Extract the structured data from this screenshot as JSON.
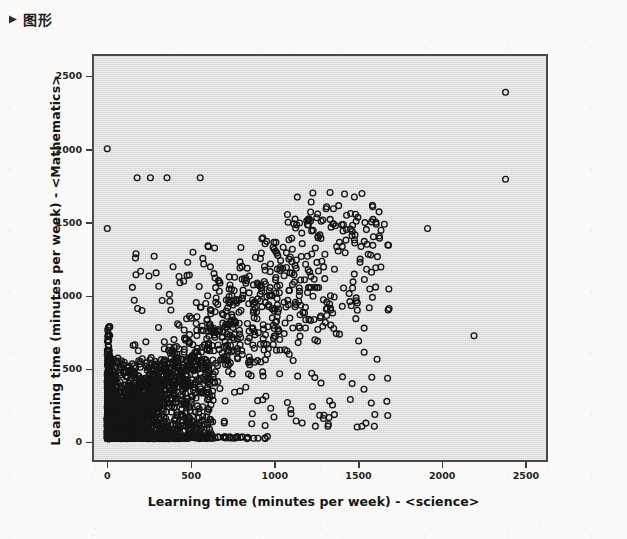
{
  "document": {
    "heading": "图形",
    "bullet_icon": "diamond-bullet-icon",
    "page_background": "#fbfaf8"
  },
  "chart_data": {
    "type": "scatter",
    "title": "",
    "xlabel": "Learning time (minutes per week) - <science>",
    "ylabel": "Learning time (minutes per week) - <Mathematics>",
    "xlim": [
      -80,
      2620
    ],
    "ylim": [
      -120,
      2640
    ],
    "xticks": [
      0,
      500,
      1000,
      1500,
      2000,
      2500
    ],
    "yticks": [
      0,
      500,
      1000,
      1500,
      2000,
      2500
    ],
    "xticklabels": [
      "0",
      "500",
      "1000",
      "1500",
      "2000",
      "2500"
    ],
    "yticklabels": [
      "0",
      "500",
      "1000",
      "1500",
      "2000",
      "2500"
    ],
    "grid": false,
    "legend": null,
    "marker": "open-circle",
    "marker_size_px": 6,
    "marker_edge_color": "#141414",
    "marker_face_color": "none",
    "plot_background": "#d6d6d6",
    "plot_border_color": "#4a4a4a",
    "n_points_drawn": 1400,
    "outliers": [
      {
        "x": 2400,
        "y": 2390
      },
      {
        "x": 2400,
        "y": 1790
      },
      {
        "x": 2210,
        "y": 710
      },
      {
        "x": 0,
        "y": 2000
      },
      {
        "x": 0,
        "y": 1450
      },
      {
        "x": 180,
        "y": 1800
      },
      {
        "x": 260,
        "y": 1800
      },
      {
        "x": 360,
        "y": 1800
      },
      {
        "x": 560,
        "y": 1800
      },
      {
        "x": 1600,
        "y": 1600
      },
      {
        "x": 1930,
        "y": 1450
      },
      {
        "x": 1500,
        "y": 1500
      },
      {
        "x": 1690,
        "y": 160
      }
    ],
    "series": [
      {
        "name": "students",
        "x_mode": 0,
        "y_mode": 0,
        "x_median": 260,
        "y_median": 260,
        "correlation": "positive, weak-to-moderate"
      }
    ]
  }
}
